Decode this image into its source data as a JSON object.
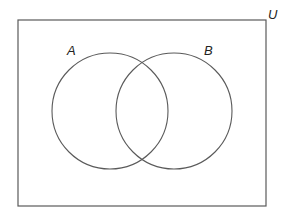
{
  "diagram": {
    "type": "venn",
    "universe": {
      "label": "U",
      "rect": {
        "x": 18,
        "y": 20,
        "width": 248,
        "height": 186
      }
    },
    "sets": [
      {
        "label": "A",
        "cx": 110,
        "cy": 111,
        "r": 58,
        "label_x": 67,
        "label_y": 55
      },
      {
        "label": "B",
        "cx": 174,
        "cy": 111,
        "r": 58,
        "label_x": 204,
        "label_y": 55
      }
    ],
    "universe_label_pos": {
      "x": 268,
      "y": 19
    },
    "stroke_color": "#5a5a5a",
    "background_color": "#ffffff"
  }
}
